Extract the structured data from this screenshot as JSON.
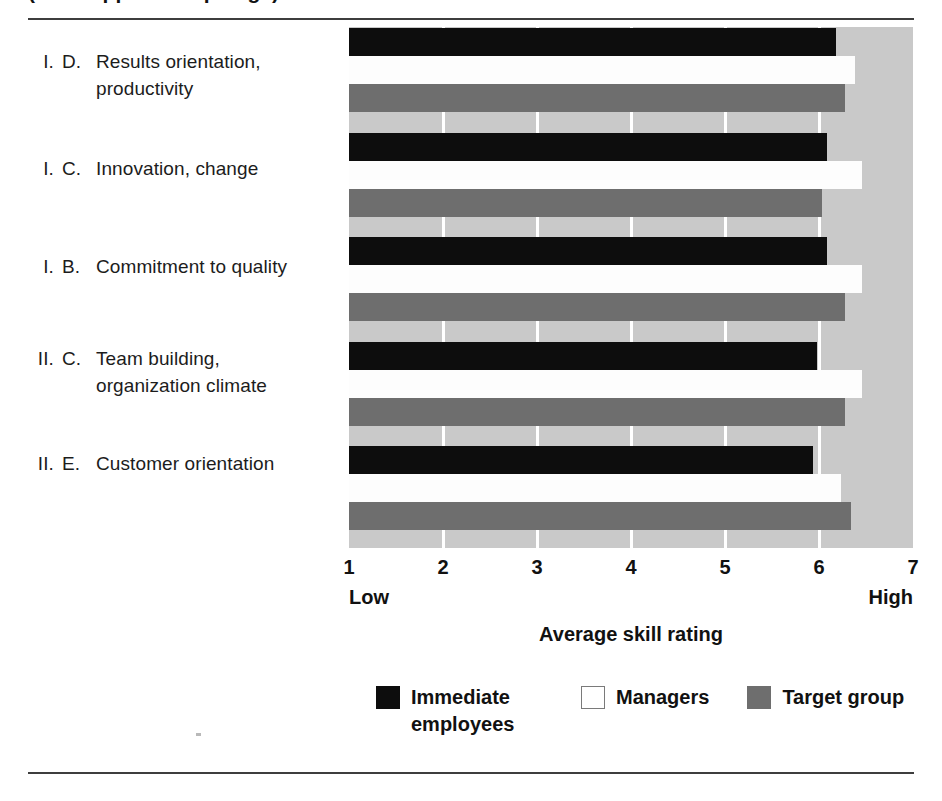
{
  "title": "(title clipped at top edge)",
  "axis": {
    "ticks": [
      "1",
      "2",
      "3",
      "4",
      "5",
      "6",
      "7"
    ],
    "low_label": "Low",
    "high_label": "High",
    "axis_title": "Average skill rating"
  },
  "legend": {
    "items": [
      {
        "label": "Immediate employees",
        "color": "#0d0d0d",
        "key": "immediate-employees"
      },
      {
        "label": "Managers",
        "color": "#ffffff",
        "key": "managers"
      },
      {
        "label": "Target group",
        "color": "#6e6e6e",
        "key": "target-group"
      }
    ]
  },
  "categories": [
    {
      "num": "I.",
      "letter": "D.",
      "line1": "Results orientation,",
      "line2": "productivity"
    },
    {
      "num": "I.",
      "letter": "C.",
      "line1": "Innovation, change",
      "line2": ""
    },
    {
      "num": "I.",
      "letter": "B.",
      "line1": "Commitment to quality",
      "line2": ""
    },
    {
      "num": "II.",
      "letter": "C.",
      "line1": "Team building,",
      "line2": "organization climate"
    },
    {
      "num": "II.",
      "letter": "E.",
      "line1": "Customer orientation",
      "line2": ""
    }
  ],
  "chart_data": {
    "type": "bar",
    "orientation": "horizontal",
    "title": "",
    "xlabel": "Average skill rating",
    "ylabel": "",
    "xlim": [
      1,
      7
    ],
    "xticks": [
      1,
      2,
      3,
      4,
      5,
      6,
      7
    ],
    "grid": true,
    "legend_position": "bottom",
    "categories": [
      "I. D. Results orientation, productivity",
      "I. C. Innovation, change",
      "I. B. Commitment to quality",
      "II. C. Team building, organization climate",
      "II. E. Customer orientation"
    ],
    "series": [
      {
        "name": "Immediate employees",
        "color": "#0d0d0d",
        "values": [
          6.18,
          6.08,
          6.08,
          5.98,
          5.94
        ]
      },
      {
        "name": "Managers",
        "color": "#ffffff",
        "values": [
          6.38,
          6.46,
          6.46,
          6.46,
          6.23
        ]
      },
      {
        "name": "Target group",
        "color": "#6e6e6e",
        "values": [
          6.28,
          6.03,
          6.28,
          6.28,
          6.34
        ]
      }
    ]
  }
}
